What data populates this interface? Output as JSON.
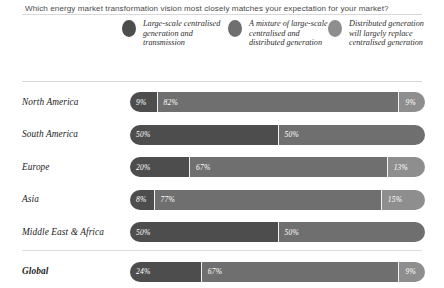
{
  "title": "Which energy market transformation vision most closely matches your expectation for your market?",
  "legend": {
    "items": [
      {
        "label": "Large-scale centralised generation and transmission",
        "color": "#4d4d4d",
        "dot": "legend-dot-dark"
      },
      {
        "label": "A mixture of large-scale centralised and distributed generation",
        "color": "#6f6f6f",
        "dot": "legend-dot-medium"
      },
      {
        "label": "Distributed generation will largely replace centralised generation",
        "color": "#8e8e8e",
        "dot": "legend-dot-light"
      }
    ]
  },
  "rows": [
    {
      "label": "North America",
      "values": [
        "9%",
        "82%",
        "9%"
      ]
    },
    {
      "label": "South America",
      "values": [
        "50%",
        "50%",
        ""
      ]
    },
    {
      "label": "Europe",
      "values": [
        "20%",
        "67%",
        "13%"
      ]
    },
    {
      "label": "Asia",
      "values": [
        "8%",
        "77%",
        "15%"
      ]
    },
    {
      "label": "Middle East & Africa",
      "values": [
        "50%",
        "50%",
        ""
      ]
    },
    {
      "label": "Global",
      "values": [
        "24%",
        "67%",
        "9%"
      ]
    }
  ],
  "chart_data": {
    "type": "bar",
    "subtype": "stacked-horizontal-100",
    "title": "Which energy market transformation vision most closely matches your expectation for your market?",
    "xlabel": "",
    "ylabel": "",
    "xlim": [
      0,
      100
    ],
    "grid": false,
    "legend_position": "top",
    "categories": [
      "North America",
      "South America",
      "Europe",
      "Asia",
      "Middle East & Africa",
      "Global"
    ],
    "series": [
      {
        "name": "Large-scale centralised generation and transmission",
        "color": "#4d4d4d",
        "values": [
          9,
          50,
          20,
          8,
          50,
          24
        ]
      },
      {
        "name": "A mixture of large-scale centralised and distributed generation",
        "color": "#6f6f6f",
        "values": [
          82,
          50,
          67,
          77,
          50,
          67
        ]
      },
      {
        "name": "Distributed generation will largely replace centralised generation",
        "color": "#8e8e8e",
        "values": [
          9,
          0,
          13,
          15,
          0,
          9
        ]
      }
    ],
    "annotations": [
      "Global row is emphasised in bold and separated by a rule"
    ]
  }
}
